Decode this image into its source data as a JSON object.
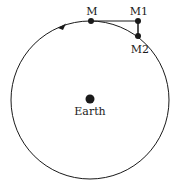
{
  "diagram": {
    "labels": {
      "m": "M",
      "m1": "M1",
      "m2": "M2",
      "earth": "Earth"
    },
    "colors": {
      "stroke": "#1a1a1a",
      "background": "#ffffff"
    }
  }
}
